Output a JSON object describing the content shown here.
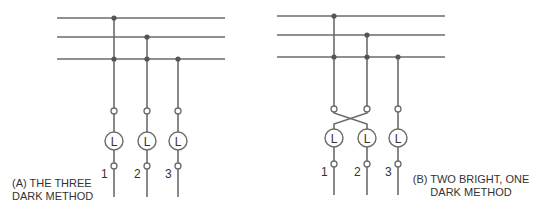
{
  "diagram": {
    "type": "generator-synchronization-lamp-methods",
    "panels": [
      {
        "id": "A",
        "caption_line1": "(A) THE THREE",
        "caption_line2": "DARK METHOD",
        "lamps": [
          {
            "label": "L",
            "phase": "1"
          },
          {
            "label": "L",
            "phase": "2"
          },
          {
            "label": "L",
            "phase": "3"
          }
        ],
        "connection": "straight"
      },
      {
        "id": "B",
        "caption_line1": "(B) TWO BRIGHT, ONE",
        "caption_line2": "DARK METHOD",
        "lamps": [
          {
            "label": "L",
            "phase": "1"
          },
          {
            "label": "L",
            "phase": "2"
          },
          {
            "label": "L",
            "phase": "3"
          }
        ],
        "connection": "crossed-1-2"
      }
    ],
    "colors": {
      "wire": "#6b6b6b",
      "junction": "#555555",
      "text": "#333333",
      "background": "#ffffff"
    }
  }
}
